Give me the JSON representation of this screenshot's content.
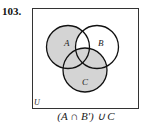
{
  "problem_number": "103.",
  "diagram": {
    "universe_label": "U",
    "sets": [
      {
        "label": "A",
        "cx": 68,
        "cy": 47,
        "r": 21.5
      },
      {
        "label": "B",
        "cx": 97,
        "cy": 47,
        "r": 21.5
      },
      {
        "label": "C",
        "cx": 85,
        "cy": 70,
        "r": 22
      }
    ],
    "shade_color": "#d4d4d4",
    "stroke_color": "#111111",
    "shaded_regions": "(A ∩ B') ∪ C"
  },
  "caption": "(A ∩ B′) ∪ C"
}
